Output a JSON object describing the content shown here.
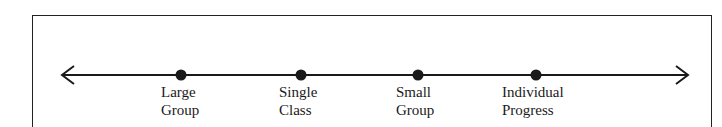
{
  "diagram": {
    "type": "continuum",
    "arrows": "both-ends",
    "points": [
      {
        "id": "large-group",
        "line1": "Large",
        "line2": "Group",
        "x": 181
      },
      {
        "id": "single-class",
        "line1": "Single",
        "line2": "Class",
        "x": 301
      },
      {
        "id": "small-group",
        "line1": "Small",
        "line2": "Group",
        "x": 418
      },
      {
        "id": "individual-progress",
        "line1": "Individual",
        "line2": "Progress",
        "x": 536
      }
    ]
  }
}
